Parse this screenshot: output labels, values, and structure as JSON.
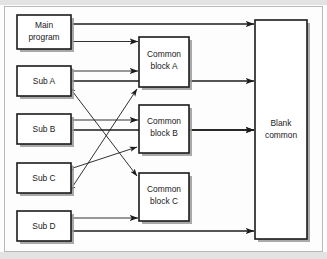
{
  "boxes": {
    "main_program": {
      "label_line1": "Main",
      "label_line2": "program"
    },
    "sub_a": {
      "label": "Sub A"
    },
    "sub_b": {
      "label": "Sub B"
    },
    "sub_c": {
      "label": "Sub C"
    },
    "sub_d": {
      "label": "Sub D"
    },
    "common_block_a": {
      "label_line1": "Common",
      "label_line2": "block A"
    },
    "common_block_b": {
      "label_line1": "Common",
      "label_line2": "block B"
    },
    "common_block_c": {
      "label_line1": "Common",
      "label_line2": "block C"
    },
    "blank_common": {
      "label_line1": "Blank",
      "label_line2": "common"
    }
  },
  "colors": {
    "box_stroke": "#1b1b1b",
    "box_fill": "#ffffff",
    "shadow": "#9a9a9a",
    "connector": "#1b1b1b",
    "frame": "#b9b9b9",
    "page_background": "#fdfdfd"
  },
  "connections": [
    {
      "name": "main-program-to-blank-common",
      "from": "main_program",
      "to": "blank_common",
      "arrow": "double",
      "style": "horizontal"
    },
    {
      "name": "main-program-to-common-block-a",
      "from": "main_program",
      "to": "common_block_a",
      "arrow": "double",
      "style": "horizontal"
    },
    {
      "name": "sub-a-to-common-block-a",
      "from": "sub_a",
      "to": "common_block_a",
      "arrow": "double",
      "style": "horizontal"
    },
    {
      "name": "sub-a-to-blank-common",
      "from": "sub_a",
      "to": "blank_common",
      "arrow": "double",
      "style": "horizontal"
    },
    {
      "name": "sub-b-to-common-block-b",
      "from": "sub_b",
      "to": "common_block_b",
      "arrow": "double",
      "style": "horizontal"
    },
    {
      "name": "sub-b-to-blank-common",
      "from": "sub_b",
      "to": "blank_common",
      "arrow": "double",
      "style": "horizontal"
    },
    {
      "name": "common-block-b-to-blank-common",
      "from": "common_block_b",
      "to": "blank_common",
      "arrow": "single",
      "style": "horizontal"
    },
    {
      "name": "sub-d-to-common-block-c",
      "from": "sub_d",
      "to": "common_block_c",
      "arrow": "double",
      "style": "horizontal"
    },
    {
      "name": "sub-d-to-blank-common",
      "from": "sub_d",
      "to": "blank_common",
      "arrow": "double",
      "style": "horizontal"
    },
    {
      "name": "sub-a-to-common-block-c",
      "from": "sub_a",
      "to": "common_block_c",
      "arrow": "double",
      "style": "diagonal"
    },
    {
      "name": "sub-c-to-common-block-a",
      "from": "sub_c",
      "to": "common_block_a",
      "arrow": "double",
      "style": "diagonal"
    },
    {
      "name": "sub-c-to-common-block-b",
      "from": "sub_c",
      "to": "common_block_b",
      "arrow": "double",
      "style": "diagonal"
    }
  ]
}
